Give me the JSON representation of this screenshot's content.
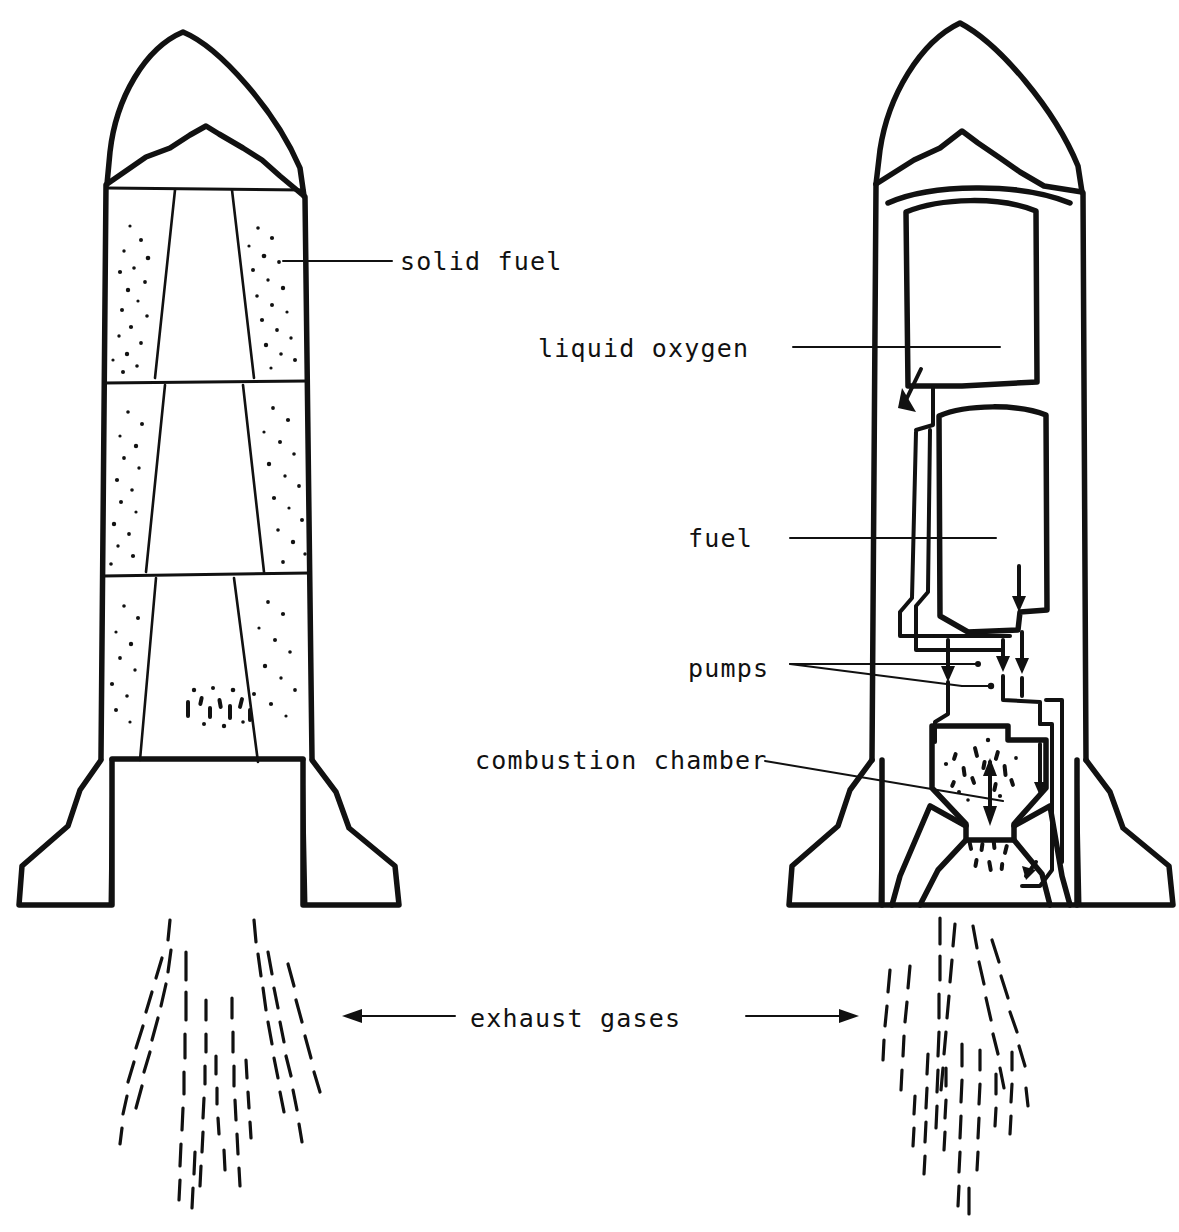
{
  "figure": {
    "ink_color": "#111111",
    "background_color": "#ffffff",
    "width": 1179,
    "height": 1232
  },
  "labels": {
    "solid_fuel": {
      "text": "solid fuel",
      "x": 400,
      "y": 270,
      "leader_from_x": 392,
      "leader_from_y": 261,
      "leader_to_x": 283,
      "leader_to_y": 261
    },
    "liquid_oxygen": {
      "text": "liquid oxygen",
      "x": 538,
      "y": 357,
      "leader_from_x": 793,
      "leader_from_y": 347,
      "leader_to_x": 1000,
      "leader_to_y": 347
    },
    "fuel": {
      "text": "fuel",
      "x": 688,
      "y": 547,
      "leader_from_x": 790,
      "leader_from_y": 538,
      "leader_to_x": 996,
      "leader_to_y": 538
    },
    "pumps": {
      "text": "pumps",
      "x": 688,
      "y": 677,
      "leader_from_x": 790,
      "leader_from_y": 664,
      "leader_to_a_x": 977,
      "leader_to_a_y": 664,
      "leader_to_b_x": 962,
      "leader_to_b_y": 686
    },
    "combustion_chamber": {
      "text": "combustion chamber",
      "x": 475,
      "y": 769,
      "leader_from_x": 765,
      "leader_from_y": 761,
      "leader_to_x": 1003,
      "leader_to_y": 801
    },
    "exhaust_gases": {
      "text": "exhaust gases",
      "x": 470,
      "y": 1027,
      "arrow_left_from_x": 455,
      "arrow_left_from_y": 1016,
      "arrow_left_to_x": 345,
      "arrow_left_to_y": 1016,
      "arrow_right_from_x": 746,
      "arrow_right_from_y": 1016,
      "arrow_right_to_x": 856,
      "arrow_right_to_y": 1016
    }
  },
  "left_rocket": {
    "name": "solid-fuel rocket",
    "stage_count": 3,
    "parts": [
      "nose-cone",
      "stage-1-solid-fuel",
      "stage-2-solid-fuel",
      "stage-3-solid-fuel",
      "left-fin",
      "right-fin",
      "exhaust-plume"
    ]
  },
  "right_rocket": {
    "name": "liquid-fuel rocket",
    "parts": [
      "nose-cone",
      "liquid-oxygen-tank",
      "fuel-tank",
      "oxygen-feed-pipe",
      "fuel-feed-pipe",
      "oxidiser-pump",
      "fuel-pump",
      "combustion-chamber",
      "nozzle",
      "cooling-jacket-pipe",
      "left-fin",
      "right-fin",
      "exhaust-plume"
    ]
  }
}
